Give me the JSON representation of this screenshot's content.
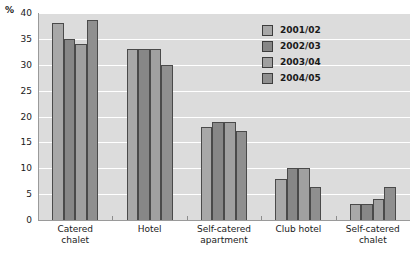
{
  "chart_data": {
    "type": "bar",
    "title": "",
    "xlabel": "",
    "ylabel": "%",
    "ylim": [
      0,
      40
    ],
    "yticks": [
      0,
      5,
      10,
      15,
      20,
      25,
      30,
      35,
      40
    ],
    "grid": true,
    "legend_position": "top-right",
    "categories": [
      "Catered\nchalet",
      "Hotel",
      "Self-catered\napartment",
      "Club hotel",
      "Self-catered\nchalet"
    ],
    "series": [
      {
        "name": "2001/02",
        "color": "#a8a8a8",
        "values": [
          38,
          33,
          18,
          8,
          3
        ]
      },
      {
        "name": "2002/03",
        "color": "#878787",
        "values": [
          35,
          33,
          19,
          10,
          3
        ]
      },
      {
        "name": "2003/04",
        "color": "#a0a0a0",
        "values": [
          34,
          33,
          19,
          10,
          4
        ]
      },
      {
        "name": "2004/05",
        "color": "#8f8f8f",
        "values": [
          38.7,
          30,
          17.2,
          6.3,
          6.3
        ]
      }
    ]
  },
  "axis": {
    "unit": "%"
  },
  "colors": {
    "plot_background": "#dcdcdc",
    "gridline": "#ffffff",
    "axis": "#9a9a9a",
    "bar_border": "#4a4a4a",
    "text": "#1a1a1a"
  }
}
